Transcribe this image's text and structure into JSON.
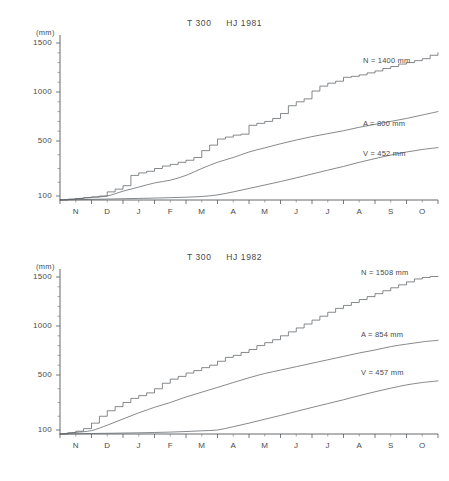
{
  "figure": {
    "unit_label": "(mm)",
    "panels": [
      {
        "id": "1981",
        "title": "T 300     HJ 1981",
        "station": "T 300",
        "period": "HJ 1981",
        "curve_labels": {
          "n": "N = 1400 mm",
          "a": "A = 800 mm",
          "v": "V = 452 mm"
        }
      },
      {
        "id": "1982",
        "title": "T 300     HJ 1982",
        "station": "T 300",
        "period": "HJ 1982",
        "curve_labels": {
          "n": "N = 1508 mm",
          "a": "A = 854 mm",
          "v": "V = 457 mm"
        }
      }
    ]
  },
  "chart_data": [
    {
      "type": "line",
      "title": "T 300     HJ 1981",
      "xlabel": "",
      "ylabel": "(mm)",
      "ylim": [
        0,
        1600
      ],
      "yticks": [
        100,
        500,
        1000,
        1500
      ],
      "ytick_labels": [
        "100",
        "500",
        "1000",
        "1500"
      ],
      "y_minor_ticks": [
        200,
        300,
        400,
        600,
        700,
        800,
        900,
        1100,
        1200,
        1300,
        1400
      ],
      "x_categories": [
        "N",
        "D",
        "J",
        "F",
        "M",
        "A",
        "M",
        "J",
        "J",
        "A",
        "S",
        "O"
      ],
      "x_note": "hydrological year, November through October",
      "grid": false,
      "legend": "inline-right-labels",
      "series": [
        {
          "name": "N",
          "label": "N = 1400 mm",
          "description": "cumulative precipitation, stepped",
          "total": 1400,
          "x": [
            0,
            0.25,
            0.5,
            0.75,
            1,
            1.25,
            1.5,
            1.75,
            2,
            2.25,
            2.5,
            2.75,
            3,
            3.25,
            3.5,
            3.75,
            4,
            4.25,
            4.5,
            4.75,
            5,
            5.25,
            5.5,
            5.75,
            6,
            6.25,
            6.5,
            6.75,
            7,
            7.25,
            7.5,
            7.75,
            8,
            8.25,
            8.5,
            8.75,
            9,
            9.25,
            9.5,
            9.75,
            10,
            10.25,
            10.5,
            10.75,
            11,
            11.25,
            11.5,
            11.75,
            12
          ],
          "values": [
            0,
            18,
            38,
            58,
            78,
            100,
            130,
            150,
            175,
            250,
            268,
            280,
            300,
            318,
            330,
            345,
            360,
            380,
            430,
            470,
            520,
            540,
            560,
            570,
            660,
            680,
            700,
            730,
            780,
            860,
            900,
            930,
            1010,
            1060,
            1090,
            1110,
            1150,
            1160,
            1175,
            1195,
            1215,
            1240,
            1260,
            1285,
            1300,
            1320,
            1340,
            1375,
            1400
          ]
        },
        {
          "name": "A",
          "label": "A = 800 mm",
          "description": "cumulative discharge, smooth",
          "total": 800,
          "x": [
            0,
            0.5,
            1,
            1.5,
            2,
            2.5,
            3,
            3.5,
            4,
            4.5,
            5,
            5.5,
            6,
            6.5,
            7,
            7.5,
            8,
            8.5,
            9,
            9.5,
            10,
            10.5,
            11,
            11.5,
            12
          ],
          "values": [
            0,
            30,
            65,
            100,
            135,
            165,
            195,
            215,
            250,
            300,
            345,
            380,
            420,
            450,
            480,
            510,
            545,
            575,
            605,
            640,
            670,
            700,
            730,
            765,
            800
          ]
        },
        {
          "name": "V",
          "label": "V = 452 mm",
          "description": "cumulative evaporation, smooth",
          "total": 452,
          "x": [
            0,
            0.5,
            1,
            1.5,
            2,
            2.5,
            3,
            3.5,
            4,
            4.5,
            5,
            5.5,
            6,
            6.5,
            7,
            7.5,
            8,
            8.5,
            9,
            9.5,
            10,
            10.5,
            11,
            11.5,
            12
          ],
          "values": [
            0,
            8,
            16,
            24,
            32,
            40,
            48,
            58,
            70,
            88,
            108,
            130,
            155,
            180,
            205,
            232,
            260,
            288,
            315,
            345,
            372,
            398,
            420,
            438,
            452
          ]
        }
      ]
    },
    {
      "type": "line",
      "title": "T 300     HJ 1982",
      "xlabel": "",
      "ylabel": "(mm)",
      "ylim": [
        0,
        1600
      ],
      "yticks": [
        100,
        500,
        1000,
        1500
      ],
      "ytick_labels": [
        "100",
        "500",
        "1000",
        "1500"
      ],
      "y_minor_ticks": [
        200,
        300,
        400,
        600,
        700,
        800,
        900,
        1100,
        1200,
        1300,
        1400
      ],
      "x_categories": [
        "N",
        "D",
        "J",
        "F",
        "M",
        "A",
        "M",
        "J",
        "J",
        "A",
        "S",
        "O"
      ],
      "x_note": "hydrological year, November through October",
      "grid": false,
      "legend": "inline-right-labels",
      "series": [
        {
          "name": "N",
          "label": "N = 1508 mm",
          "description": "cumulative precipitation, stepped",
          "total": 1508,
          "x": [
            0,
            0.25,
            0.5,
            0.75,
            1,
            1.25,
            1.5,
            1.75,
            2,
            2.25,
            2.5,
            2.75,
            3,
            3.25,
            3.5,
            3.75,
            4,
            4.25,
            4.5,
            4.75,
            5,
            5.25,
            5.5,
            5.75,
            6,
            6.25,
            6.5,
            6.75,
            7,
            7.25,
            7.5,
            7.75,
            8,
            8.25,
            8.5,
            8.75,
            9,
            9.25,
            9.5,
            9.75,
            10,
            10.25,
            10.5,
            10.75,
            11,
            11.25,
            11.5,
            11.75,
            12
          ],
          "values": [
            0,
            30,
            70,
            110,
            150,
            200,
            240,
            270,
            300,
            330,
            350,
            370,
            400,
            440,
            470,
            490,
            520,
            545,
            575,
            600,
            640,
            680,
            700,
            730,
            760,
            800,
            830,
            860,
            900,
            940,
            980,
            1020,
            1060,
            1100,
            1140,
            1180,
            1210,
            1240,
            1270,
            1300,
            1330,
            1360,
            1390,
            1420,
            1450,
            1480,
            1495,
            1505,
            1508
          ]
        },
        {
          "name": "A",
          "label": "A = 854 mm",
          "description": "cumulative discharge, smooth",
          "total": 854,
          "x": [
            0,
            0.5,
            1,
            1.5,
            2,
            2.5,
            3,
            3.5,
            4,
            4.5,
            5,
            5.5,
            6,
            6.5,
            7,
            7.5,
            8,
            8.5,
            9,
            9.5,
            10,
            10.5,
            11,
            11.5,
            12
          ],
          "values": [
            0,
            40,
            85,
            135,
            180,
            225,
            265,
            300,
            340,
            375,
            410,
            445,
            480,
            515,
            550,
            585,
            620,
            655,
            690,
            725,
            755,
            790,
            815,
            838,
            854
          ]
        },
        {
          "name": "V",
          "label": "V = 457 mm",
          "description": "cumulative evaporation, smooth",
          "total": 457,
          "x": [
            0,
            0.5,
            1,
            1.5,
            2,
            2.5,
            3,
            3.5,
            4,
            4.5,
            5,
            5.5,
            6,
            6.5,
            7,
            7.5,
            8,
            8.5,
            9,
            9.5,
            10,
            10.5,
            11,
            11.5,
            12
          ],
          "values": [
            0,
            6,
            12,
            18,
            24,
            30,
            38,
            48,
            62,
            80,
            100,
            124,
            150,
            178,
            206,
            235,
            264,
            292,
            320,
            350,
            378,
            404,
            428,
            445,
            457
          ]
        }
      ]
    }
  ]
}
